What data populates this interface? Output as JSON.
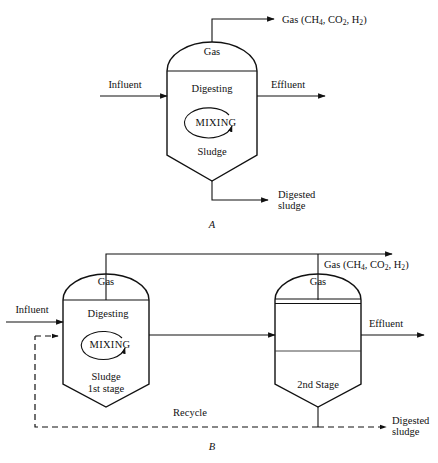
{
  "figure": {
    "panels": [
      {
        "letter": "A",
        "name": "single-stage-digester",
        "gas_outlet_label": {
          "prefix": "Gas (CH",
          "sub1": "4",
          "mid1": ", CO",
          "sub2": "2",
          "mid2": ", H",
          "sub3": "2",
          "suffix": ")"
        },
        "vessel": {
          "dome_label": "Gas",
          "zone_label": "Digesting",
          "mixing_label": "MIXING",
          "sludge_label": "Sludge"
        },
        "inlet_label": "Influent",
        "outlet_label": "Effluent",
        "bottom_outlet_line1": "Digested",
        "bottom_outlet_line2": "sludge"
      },
      {
        "letter": "B",
        "name": "two-stage-digester",
        "gas_outlet_label": {
          "prefix": "Gas (CH",
          "sub1": "4",
          "mid1": ", CO",
          "sub2": "2",
          "mid2": ", H",
          "sub3": "2",
          "suffix": ")"
        },
        "stage1": {
          "dome_label": "Gas",
          "zone_label": "Digesting",
          "mixing_label": "MIXING",
          "sludge_label": "Sludge",
          "stage_label": "1st stage"
        },
        "stage2": {
          "dome_label": "Gas",
          "stage_label": "2nd Stage"
        },
        "inlet_label": "Influent",
        "outlet_label": "Effluent",
        "recycle_label": "Recycle",
        "bottom_outlet_line1": "Digested",
        "bottom_outlet_line2": "sludge"
      }
    ],
    "colors": {
      "stroke": "#111111",
      "background": "#ffffff"
    }
  }
}
